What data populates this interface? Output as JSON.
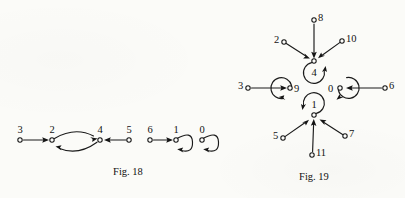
{
  "page": {
    "background_color": "#fbfbf8",
    "ink_color": "#1a1a1a",
    "kind": "scanned-textbook-figures"
  },
  "figures": [
    {
      "caption": "Fig. 18",
      "nodes": [
        {
          "id": "3",
          "label": "3"
        },
        {
          "id": "2",
          "label": "2"
        },
        {
          "id": "4",
          "label": "4"
        },
        {
          "id": "5",
          "label": "5"
        },
        {
          "id": "6",
          "label": "6"
        },
        {
          "id": "1",
          "label": "1"
        },
        {
          "id": "0",
          "label": "0"
        }
      ],
      "edges": [
        {
          "from": "3",
          "to": "2",
          "style": "straight"
        },
        {
          "from": "2",
          "to": "4",
          "style": "arc-upper"
        },
        {
          "from": "4",
          "to": "2",
          "style": "arc-lower"
        },
        {
          "from": "5",
          "to": "4",
          "style": "straight"
        },
        {
          "from": "6",
          "to": "1",
          "style": "straight"
        },
        {
          "from": "1",
          "to": "1",
          "style": "self-loop"
        },
        {
          "from": "0",
          "to": "0",
          "style": "self-loop"
        }
      ]
    },
    {
      "caption": "Fig. 19",
      "nodes": [
        {
          "id": "8",
          "label": "8"
        },
        {
          "id": "2",
          "label": "2"
        },
        {
          "id": "10",
          "label": "10"
        },
        {
          "id": "4",
          "label": "4"
        },
        {
          "id": "3",
          "label": "3"
        },
        {
          "id": "9",
          "label": "9"
        },
        {
          "id": "0",
          "label": "0"
        },
        {
          "id": "6",
          "label": "6"
        },
        {
          "id": "1",
          "label": "1"
        },
        {
          "id": "5",
          "label": "5"
        },
        {
          "id": "11",
          "label": "11"
        },
        {
          "id": "7",
          "label": "7"
        }
      ],
      "edges": [
        {
          "from": "8",
          "to": "4",
          "style": "straight"
        },
        {
          "from": "2",
          "to": "4",
          "style": "straight"
        },
        {
          "from": "10",
          "to": "4",
          "style": "straight"
        },
        {
          "from": "3",
          "to": "9",
          "style": "straight"
        },
        {
          "from": "6",
          "to": "0",
          "style": "straight"
        },
        {
          "from": "5",
          "to": "1",
          "style": "straight"
        },
        {
          "from": "11",
          "to": "1",
          "style": "straight"
        },
        {
          "from": "7",
          "to": "1",
          "style": "straight"
        },
        {
          "from": "4",
          "to": "0",
          "style": "arc-cycle"
        },
        {
          "from": "0",
          "to": "1",
          "style": "arc-cycle"
        },
        {
          "from": "1",
          "to": "9",
          "style": "arc-cycle"
        },
        {
          "from": "9",
          "to": "4",
          "style": "arc-cycle"
        }
      ]
    }
  ]
}
